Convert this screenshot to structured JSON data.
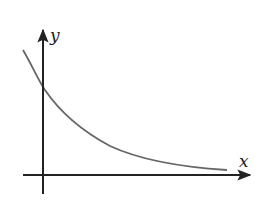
{
  "figure": {
    "type": "decay-curve-sketch",
    "x_axis": {
      "label": "x"
    },
    "y_axis": {
      "label": "y"
    },
    "curve": {
      "description": "exponentially decreasing curve crossing the y-axis and approaching the x-axis asymptotically",
      "color": "#666666"
    },
    "axis_color": "#222222"
  }
}
